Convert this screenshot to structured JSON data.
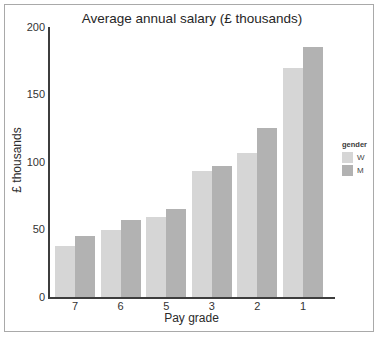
{
  "chart_data": {
    "type": "bar",
    "title": "Average annual salary (£ thousands)",
    "xlabel": "Pay grade",
    "ylabel": "£ thousands",
    "categories": [
      "7",
      "6",
      "5",
      "3",
      "2",
      "1"
    ],
    "series": [
      {
        "name": "W",
        "color": "#d6d6d6",
        "values": [
          38,
          50,
          59,
          93,
          107,
          170
        ]
      },
      {
        "name": "M",
        "color": "#b2b2b2",
        "values": [
          45,
          57,
          65,
          97,
          125,
          185
        ]
      }
    ],
    "ylim": [
      0,
      200
    ],
    "yticks": [
      0,
      50,
      100,
      150,
      200
    ],
    "grid": false,
    "legend_title": "gender",
    "legend_position": "right"
  },
  "colors": {
    "frame_border": "#a9a9a9",
    "axis": "#3d3d3d",
    "background": "#ffffff"
  }
}
